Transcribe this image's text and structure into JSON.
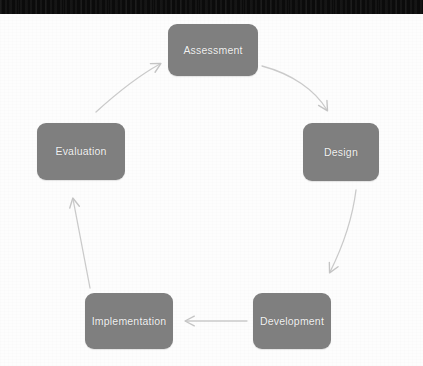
{
  "figure": {
    "kind": "cycle-diagram",
    "background_color": "#fdfdfd",
    "top_banner_color": "#0b0b0b",
    "node_fill_color": "#7f7f7f",
    "node_text_color": "#f2f2f2",
    "arrow_color": "#c9c9c9"
  },
  "nodes": [
    {
      "id": "assessment",
      "label": "Assessment"
    },
    {
      "id": "design",
      "label": "Design"
    },
    {
      "id": "development",
      "label": "Development"
    },
    {
      "id": "implementation",
      "label": "Implementation"
    },
    {
      "id": "evaluation",
      "label": "Evaluation"
    }
  ],
  "arrows": [
    {
      "id": "assessment-to-design",
      "from": "Assessment",
      "to": "Design",
      "direction": "down-right",
      "style": "curved"
    },
    {
      "id": "design-to-development",
      "from": "Design",
      "to": "Development",
      "direction": "down-left",
      "style": "curved"
    },
    {
      "id": "development-to-implementation",
      "from": "Development",
      "to": "Implementation",
      "direction": "left",
      "style": "straight"
    },
    {
      "id": "implementation-to-evaluation",
      "from": "Implementation",
      "to": "Evaluation",
      "direction": "up",
      "style": "straight"
    },
    {
      "id": "evaluation-to-assessment",
      "from": "Evaluation",
      "to": "Assessment",
      "direction": "up-right",
      "style": "curved"
    }
  ]
}
